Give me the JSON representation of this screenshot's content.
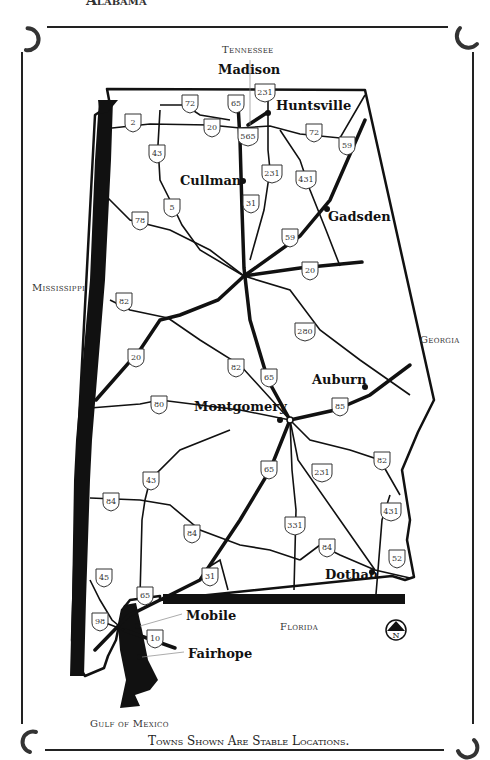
{
  "header": {
    "title_partial": "Alabama"
  },
  "states": {
    "north": "Tennessee",
    "west": "Mississippi",
    "east": "Georgia",
    "south_east": "Florida",
    "south": "Gulf of Mexico"
  },
  "cities": [
    {
      "name": "Madison",
      "x": 218,
      "y": 63
    },
    {
      "name": "Huntsville",
      "x": 276,
      "y": 99
    },
    {
      "name": "Cullman",
      "x": 180,
      "y": 174
    },
    {
      "name": "Gadsden",
      "x": 328,
      "y": 210
    },
    {
      "name": "Auburn",
      "x": 312,
      "y": 373
    },
    {
      "name": "Montgomery",
      "x": 194,
      "y": 400
    },
    {
      "name": "Dothan",
      "x": 325,
      "y": 568
    },
    {
      "name": "Mobile",
      "x": 186,
      "y": 609
    },
    {
      "name": "Fairhope",
      "x": 188,
      "y": 647
    }
  ],
  "routes": [
    {
      "num": "72",
      "x": 190,
      "y": 103
    },
    {
      "num": "65",
      "x": 236,
      "y": 103
    },
    {
      "num": "231",
      "x": 265,
      "y": 92
    },
    {
      "num": "2",
      "x": 133,
      "y": 122
    },
    {
      "num": "20",
      "x": 212,
      "y": 127
    },
    {
      "num": "565",
      "x": 248,
      "y": 136
    },
    {
      "num": "72",
      "x": 314,
      "y": 132
    },
    {
      "num": "59",
      "x": 347,
      "y": 145
    },
    {
      "num": "43",
      "x": 157,
      "y": 153
    },
    {
      "num": "231",
      "x": 272,
      "y": 173
    },
    {
      "num": "431",
      "x": 306,
      "y": 179
    },
    {
      "name": "",
      "num": "31",
      "x": 251,
      "y": 203
    },
    {
      "num": "5",
      "x": 172,
      "y": 207
    },
    {
      "num": "78",
      "x": 140,
      "y": 220
    },
    {
      "num": "59",
      "x": 290,
      "y": 237
    },
    {
      "num": "20",
      "x": 310,
      "y": 270
    },
    {
      "num": "82",
      "x": 124,
      "y": 301
    },
    {
      "num": "280",
      "x": 305,
      "y": 331
    },
    {
      "num": "20",
      "x": 136,
      "y": 357
    },
    {
      "num": "65",
      "x": 269,
      "y": 377
    },
    {
      "num": "82",
      "x": 236,
      "y": 367
    },
    {
      "num": "80",
      "x": 159,
      "y": 404
    },
    {
      "num": "85",
      "x": 340,
      "y": 406
    },
    {
      "num": "231",
      "x": 322,
      "y": 472
    },
    {
      "num": "82",
      "x": 382,
      "y": 460
    },
    {
      "num": "65",
      "x": 269,
      "y": 469
    },
    {
      "num": "43",
      "x": 151,
      "y": 480
    },
    {
      "num": "84",
      "x": 111,
      "y": 501
    },
    {
      "num": "431",
      "x": 391,
      "y": 511
    },
    {
      "num": "84",
      "x": 192,
      "y": 533
    },
    {
      "num": "331",
      "x": 295,
      "y": 525
    },
    {
      "num": "84",
      "x": 327,
      "y": 547
    },
    {
      "num": "52",
      "x": 397,
      "y": 558
    },
    {
      "num": "45",
      "x": 104,
      "y": 577
    },
    {
      "num": "31",
      "x": 210,
      "y": 576
    },
    {
      "num": "65",
      "x": 145,
      "y": 595
    },
    {
      "num": "98",
      "x": 100,
      "y": 621
    },
    {
      "num": "10",
      "x": 155,
      "y": 638
    }
  ],
  "compass": {
    "label": "N"
  },
  "footer": {
    "note": "Towns Shown Are Stable Locations."
  },
  "colors": {
    "ink": "#111111",
    "paper": "#ffffff",
    "label": "#333333"
  }
}
